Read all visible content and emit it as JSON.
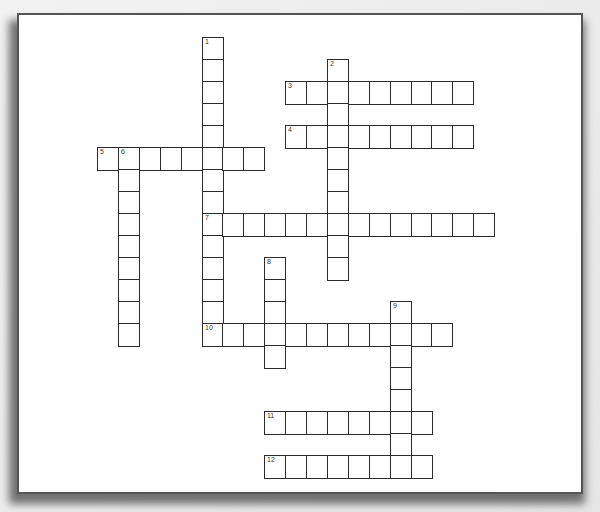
{
  "puzzle": {
    "type": "crossword",
    "grid_origin": {
      "x": 97,
      "y": 37
    },
    "cell": {
      "w": 20.9,
      "h": 22
    },
    "colors": {
      "border": "#2b2b2b",
      "frame": "#555555",
      "background": "#ececec",
      "paper": "#ffffff"
    },
    "entries": [
      {
        "number": "1",
        "dir": "down",
        "col": 5,
        "row": 0,
        "length": 14
      },
      {
        "number": "2",
        "dir": "down",
        "col": 11,
        "row": 1,
        "length": 10
      },
      {
        "number": "3",
        "dir": "across",
        "col": 9,
        "row": 2,
        "length": 9
      },
      {
        "number": "4",
        "dir": "across",
        "col": 9,
        "row": 4,
        "length": 9
      },
      {
        "number": "5",
        "dir": "across",
        "col": 0,
        "row": 5,
        "length": 8
      },
      {
        "number": "6",
        "dir": "down",
        "col": 1,
        "row": 5,
        "length": 9
      },
      {
        "number": "7",
        "dir": "across",
        "col": 5,
        "row": 8,
        "length": 14
      },
      {
        "number": "8",
        "dir": "down",
        "col": 8,
        "row": 10,
        "length": 5
      },
      {
        "number": "9",
        "dir": "down",
        "col": 14,
        "row": 12,
        "length": 8
      },
      {
        "number": "10",
        "dir": "across",
        "col": 5,
        "row": 13,
        "length": 12
      },
      {
        "number": "11",
        "dir": "across",
        "col": 8,
        "row": 17,
        "length": 8
      },
      {
        "number": "12",
        "dir": "across",
        "col": 8,
        "row": 19,
        "length": 8
      }
    ]
  }
}
